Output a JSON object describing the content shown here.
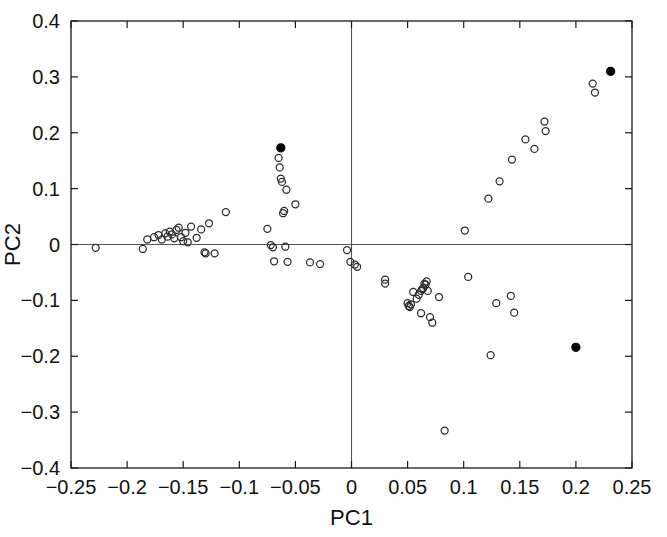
{
  "chart_data": {
    "type": "scatter",
    "title": "",
    "xlabel": "PC1",
    "ylabel": "PC2",
    "xlim": [
      -0.25,
      0.25
    ],
    "ylim": [
      -0.4,
      0.4
    ],
    "xticks": [
      -0.25,
      -0.2,
      -0.15,
      -0.1,
      -0.05,
      0,
      0.05,
      0.1,
      0.15,
      0.2,
      0.25
    ],
    "xticklabels": [
      "−0.25",
      "−0.2",
      "−0.15",
      "−0.1",
      "−0.05",
      "0",
      "0.05",
      "0.1",
      "0.15",
      "0.2",
      "0.25"
    ],
    "yticks": [
      -0.4,
      -0.3,
      -0.2,
      -0.1,
      0,
      0.1,
      0.2,
      0.3,
      0.4
    ],
    "yticklabels": [
      "−0.4",
      "−0.3",
      "−0.2",
      "−0.1",
      "0",
      "0.1",
      "0.2",
      "0.3",
      "0.4"
    ],
    "grid": false,
    "legend": null,
    "reference_lines": [
      {
        "axis": "x",
        "value": 0
      },
      {
        "axis": "y",
        "value": 0
      }
    ],
    "series": [
      {
        "name": "samples",
        "marker": "open-circle",
        "marker_size": 7,
        "color": "#2b2b2b",
        "points": [
          [
            -0.228,
            -0.006
          ],
          [
            -0.186,
            -0.008
          ],
          [
            -0.182,
            0.009
          ],
          [
            -0.176,
            0.013
          ],
          [
            -0.172,
            0.017
          ],
          [
            -0.169,
            0.009
          ],
          [
            -0.166,
            0.02
          ],
          [
            -0.164,
            0.014
          ],
          [
            -0.162,
            0.023
          ],
          [
            -0.16,
            0.018
          ],
          [
            -0.158,
            0.011
          ],
          [
            -0.156,
            0.026
          ],
          [
            -0.154,
            0.03
          ],
          [
            -0.152,
            0.013
          ],
          [
            -0.15,
            0.006
          ],
          [
            -0.148,
            0.021
          ],
          [
            -0.146,
            0.004
          ],
          [
            -0.143,
            0.032
          ],
          [
            -0.138,
            0.012
          ],
          [
            -0.134,
            0.027
          ],
          [
            -0.131,
            -0.014
          ],
          [
            -0.13,
            -0.016
          ],
          [
            -0.127,
            0.038
          ],
          [
            -0.122,
            -0.016
          ],
          [
            -0.112,
            0.058
          ],
          [
            -0.075,
            0.028
          ],
          [
            -0.072,
            -0.001
          ],
          [
            -0.07,
            -0.005
          ],
          [
            -0.069,
            -0.03
          ],
          [
            -0.065,
            0.155
          ],
          [
            -0.064,
            0.138
          ],
          [
            -0.063,
            0.118
          ],
          [
            -0.062,
            0.112
          ],
          [
            -0.061,
            0.056
          ],
          [
            -0.06,
            0.06
          ],
          [
            -0.059,
            -0.004
          ],
          [
            -0.058,
            0.098
          ],
          [
            -0.057,
            -0.031
          ],
          [
            -0.05,
            0.072
          ],
          [
            -0.037,
            -0.032
          ],
          [
            -0.028,
            -0.035
          ],
          [
            -0.004,
            -0.01
          ],
          [
            -0.001,
            -0.031
          ],
          [
            0.003,
            -0.036
          ],
          [
            0.005,
            -0.04
          ],
          [
            0.03,
            -0.063
          ],
          [
            0.03,
            -0.07
          ],
          [
            0.05,
            -0.105
          ],
          [
            0.051,
            -0.11
          ],
          [
            0.052,
            -0.112
          ],
          [
            0.053,
            -0.107
          ],
          [
            0.055,
            -0.085
          ],
          [
            0.058,
            -0.097
          ],
          [
            0.06,
            -0.09
          ],
          [
            0.062,
            -0.083
          ],
          [
            0.063,
            -0.08
          ],
          [
            0.064,
            -0.078
          ],
          [
            0.065,
            -0.07
          ],
          [
            0.066,
            -0.072
          ],
          [
            0.067,
            -0.066
          ],
          [
            0.068,
            -0.083
          ],
          [
            0.062,
            -0.123
          ],
          [
            0.07,
            -0.13
          ],
          [
            0.072,
            -0.14
          ],
          [
            0.078,
            -0.094
          ],
          [
            0.083,
            -0.333
          ],
          [
            0.101,
            0.025
          ],
          [
            0.104,
            -0.058
          ],
          [
            0.122,
            0.082
          ],
          [
            0.124,
            -0.198
          ],
          [
            0.129,
            -0.105
          ],
          [
            0.132,
            0.113
          ],
          [
            0.142,
            -0.092
          ],
          [
            0.143,
            0.152
          ],
          [
            0.145,
            -0.122
          ],
          [
            0.155,
            0.188
          ],
          [
            0.163,
            0.171
          ],
          [
            0.172,
            0.22
          ],
          [
            0.173,
            0.203
          ],
          [
            0.215,
            0.288
          ],
          [
            0.217,
            0.272
          ]
        ]
      },
      {
        "name": "highlighted",
        "marker": "filled-circle",
        "marker_size": 7,
        "color": "#000000",
        "points": [
          [
            -0.063,
            0.173
          ],
          [
            0.231,
            0.31
          ],
          [
            0.2,
            -0.184
          ]
        ]
      }
    ]
  },
  "figure": {
    "background": "#ffffff",
    "axis_color": "#1a1a1a",
    "zero_line_color": "#555555"
  }
}
